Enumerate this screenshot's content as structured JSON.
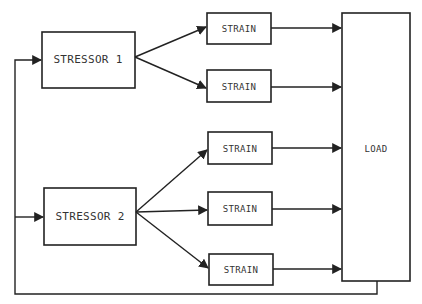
{
  "diagram": {
    "colors": {
      "ink": "#222222",
      "background": "#ffffff"
    },
    "stressors": [
      {
        "label": "Stressor 1",
        "display_label": "STRESSOR  1"
      },
      {
        "label": "Stressor 2",
        "display_label": "STRESSOR 2"
      }
    ],
    "strains": [
      {
        "label": "STRAIN",
        "source": "Stressor 1"
      },
      {
        "label": "STRAIN",
        "source": "Stressor 1"
      },
      {
        "label": "STRAIN",
        "source": "Stressor 2"
      },
      {
        "label": "STRAIN",
        "source": "Stressor 2"
      },
      {
        "label": "STRAIN",
        "source": "Stressor 2"
      }
    ],
    "load": {
      "label": "LOAD"
    },
    "feedback": {
      "from": "LOAD",
      "to": [
        "Stressor 1",
        "Stressor 2"
      ]
    }
  }
}
